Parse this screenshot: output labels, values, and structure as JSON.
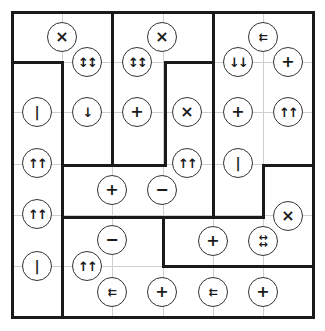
{
  "puzzle": {
    "grid": {
      "cols": 6,
      "rows": 6,
      "x": [
        12,
        62,
        112,
        163,
        213,
        263,
        313
      ],
      "y": [
        12,
        62,
        112,
        164,
        215,
        266,
        317
      ]
    },
    "colors": {
      "wall": "#1a1a1a",
      "gridline": "#cfcfcf",
      "background": "#ffffff",
      "clue_border": "#333333"
    },
    "walls": [
      {
        "x1": 12,
        "y1": 12,
        "x2": 313,
        "y2": 12
      },
      {
        "x1": 12,
        "y1": 317,
        "x2": 313,
        "y2": 317
      },
      {
        "x1": 12,
        "y1": 12,
        "x2": 12,
        "y2": 317
      },
      {
        "x1": 313,
        "y1": 12,
        "x2": 313,
        "y2": 317
      },
      {
        "x1": 12,
        "y1": 62,
        "x2": 62,
        "y2": 62
      },
      {
        "x1": 62,
        "y1": 62,
        "x2": 62,
        "y2": 317
      },
      {
        "x1": 112,
        "y1": 12,
        "x2": 112,
        "y2": 165
      },
      {
        "x1": 62,
        "y1": 165,
        "x2": 165,
        "y2": 165
      },
      {
        "x1": 165,
        "y1": 62,
        "x2": 165,
        "y2": 165
      },
      {
        "x1": 165,
        "y1": 62,
        "x2": 213,
        "y2": 62
      },
      {
        "x1": 213,
        "y1": 12,
        "x2": 213,
        "y2": 217
      },
      {
        "x1": 62,
        "y1": 217,
        "x2": 263,
        "y2": 217
      },
      {
        "x1": 263,
        "y1": 165,
        "x2": 263,
        "y2": 217
      },
      {
        "x1": 263,
        "y1": 165,
        "x2": 313,
        "y2": 165
      },
      {
        "x1": 163,
        "y1": 217,
        "x2": 163,
        "y2": 266
      },
      {
        "x1": 163,
        "y1": 266,
        "x2": 313,
        "y2": 266
      }
    ],
    "clues": [
      {
        "x": 62,
        "y": 37,
        "symbol": "×",
        "kind": "times"
      },
      {
        "x": 87,
        "y": 62,
        "symbol": "↕↕",
        "kind": "updown"
      },
      {
        "x": 137,
        "y": 62,
        "symbol": "↕↕",
        "kind": "updown"
      },
      {
        "x": 162,
        "y": 37,
        "symbol": "×",
        "kind": "times"
      },
      {
        "x": 263,
        "y": 37,
        "symbol": "⇇",
        "kind": "ll"
      },
      {
        "x": 238,
        "y": 62,
        "symbol": "↓↓",
        "kind": "dd"
      },
      {
        "x": 288,
        "y": 62,
        "symbol": "+",
        "kind": "plus"
      },
      {
        "x": 37,
        "y": 112,
        "symbol": "|",
        "kind": "bar"
      },
      {
        "x": 87,
        "y": 112,
        "symbol": "↓",
        "kind": "down"
      },
      {
        "x": 137,
        "y": 112,
        "symbol": "+",
        "kind": "plus"
      },
      {
        "x": 187,
        "y": 112,
        "symbol": "×",
        "kind": "times"
      },
      {
        "x": 238,
        "y": 112,
        "symbol": "+",
        "kind": "plus"
      },
      {
        "x": 288,
        "y": 112,
        "symbol": "↑↑",
        "kind": "uu"
      },
      {
        "x": 37,
        "y": 163,
        "symbol": "↑↑",
        "kind": "uu"
      },
      {
        "x": 187,
        "y": 163,
        "symbol": "↑↑",
        "kind": "uu"
      },
      {
        "x": 238,
        "y": 163,
        "symbol": "|",
        "kind": "bar"
      },
      {
        "x": 112,
        "y": 190,
        "symbol": "+",
        "kind": "plus"
      },
      {
        "x": 162,
        "y": 190,
        "symbol": "−",
        "kind": "minus"
      },
      {
        "x": 37,
        "y": 214,
        "symbol": "↑↑",
        "kind": "uu"
      },
      {
        "x": 288,
        "y": 216,
        "symbol": "×",
        "kind": "times"
      },
      {
        "x": 112,
        "y": 240,
        "symbol": "−",
        "kind": "minus"
      },
      {
        "x": 213,
        "y": 241,
        "symbol": "+",
        "kind": "plus"
      },
      {
        "x": 263,
        "y": 241,
        "symbol": "↔\n↔",
        "kind": "lrlr"
      },
      {
        "x": 37,
        "y": 266,
        "symbol": "|",
        "kind": "bar"
      },
      {
        "x": 87,
        "y": 266,
        "symbol": "↑↑",
        "kind": "uu"
      },
      {
        "x": 112,
        "y": 292,
        "symbol": "⇇",
        "kind": "ll"
      },
      {
        "x": 162,
        "y": 292,
        "symbol": "+",
        "kind": "plus"
      },
      {
        "x": 213,
        "y": 292,
        "symbol": "⇇",
        "kind": "ll"
      },
      {
        "x": 263,
        "y": 292,
        "symbol": "+",
        "kind": "plus"
      }
    ]
  }
}
